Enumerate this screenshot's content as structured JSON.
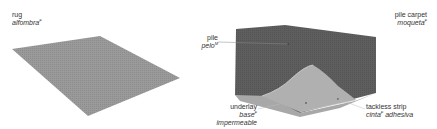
{
  "colors": {
    "rug": "#9a9a9a",
    "carpet": "#5e5e5e",
    "carpet_side": "#6a6a6a",
    "underlay": "#b4b4b4",
    "leader_line": "#8a8a8a",
    "text": "#333333"
  },
  "items": {
    "rug": {
      "en": "rug",
      "es": "alfombra",
      "gender": "F"
    },
    "pile_carpet": {
      "en": "pile carpet",
      "es": "moqueta",
      "gender": "F"
    },
    "pile": {
      "en": "pile",
      "es": "pelo",
      "gender": "M"
    },
    "underlay": {
      "en": "underlay",
      "es_base": "base",
      "es_rest": "impermeable",
      "gender": "F"
    },
    "tackless_strip": {
      "en": "tackless strip",
      "es_base": "cinta",
      "es_rest": "adhesiva",
      "gender": "F"
    }
  }
}
